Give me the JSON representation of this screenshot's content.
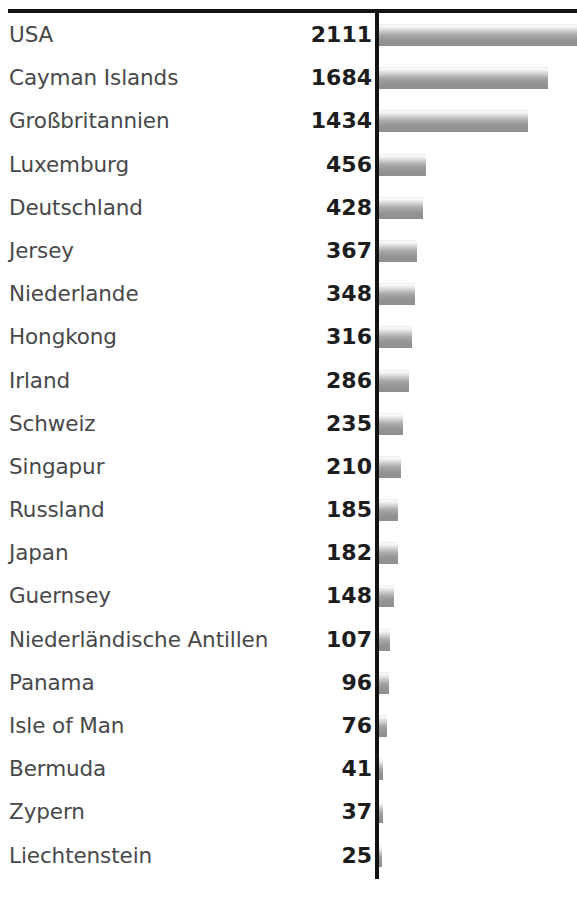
{
  "chart_data": {
    "type": "bar",
    "orientation": "horizontal",
    "title": "",
    "subtitle": "",
    "xlabel": "",
    "ylabel": "",
    "grid": false,
    "legend": null,
    "value_labels_shown": true,
    "axis_max_visible": 1920,
    "categories": [
      "USA",
      "Cayman Islands",
      "Großbritannien",
      "Luxemburg",
      "Deutschland",
      "Jersey",
      "Niederlande",
      "Hongkong",
      "Irland",
      "Schweiz",
      "Singapur",
      "Russland",
      "Japan",
      "Guernsey",
      "Niederländische Antillen",
      "Panama",
      "Isle of Man",
      "Bermuda",
      "Zypern",
      "Liechtenstein"
    ],
    "values": [
      2111,
      1684,
      1434,
      456,
      428,
      367,
      348,
      316,
      286,
      235,
      210,
      185,
      182,
      148,
      107,
      96,
      76,
      41,
      37,
      25
    ]
  },
  "rows": [
    {
      "label": "USA",
      "value": "2111",
      "bar_px": 198,
      "clipped": true
    },
    {
      "label": "Cayman Islands",
      "value": "1684",
      "bar_px": 169,
      "clipped": false
    },
    {
      "label": "Großbritannien",
      "value": "1434",
      "bar_px": 149,
      "clipped": false
    },
    {
      "label": "Luxemburg",
      "value": "456",
      "bar_px": 47,
      "clipped": false
    },
    {
      "label": "Deutschland",
      "value": "428",
      "bar_px": 44,
      "clipped": false
    },
    {
      "label": "Jersey",
      "value": "367",
      "bar_px": 38,
      "clipped": false
    },
    {
      "label": "Niederlande",
      "value": "348",
      "bar_px": 36,
      "clipped": false
    },
    {
      "label": "Hongkong",
      "value": "316",
      "bar_px": 33,
      "clipped": false
    },
    {
      "label": "Irland",
      "value": "286",
      "bar_px": 30,
      "clipped": false
    },
    {
      "label": "Schweiz",
      "value": "235",
      "bar_px": 24,
      "clipped": false
    },
    {
      "label": "Singapur",
      "value": "210",
      "bar_px": 22,
      "clipped": false
    },
    {
      "label": "Russland",
      "value": "185",
      "bar_px": 19,
      "clipped": false
    },
    {
      "label": "Japan",
      "value": "182",
      "bar_px": 19,
      "clipped": false
    },
    {
      "label": "Guernsey",
      "value": "148",
      "bar_px": 15,
      "clipped": false
    },
    {
      "label": "Niederländische Antillen",
      "value": "107",
      "bar_px": 11,
      "clipped": false
    },
    {
      "label": "Panama",
      "value": "96",
      "bar_px": 10,
      "clipped": false
    },
    {
      "label": "Isle of Man",
      "value": "76",
      "bar_px": 8,
      "clipped": false
    },
    {
      "label": "Bermuda",
      "value": "41",
      "bar_px": 4,
      "clipped": false
    },
    {
      "label": "Zypern",
      "value": "37",
      "bar_px": 4,
      "clipped": false
    },
    {
      "label": "Liechtenstein",
      "value": "25",
      "bar_px": 3,
      "clipped": false
    }
  ],
  "colors": {
    "rule": "#141414",
    "axis": "#131313",
    "label_text": "#48484a",
    "value_text": "#1d1d1d",
    "bar_light": "#fdfdfd",
    "bar_dark": "#8f8f8f",
    "background": "#ffffff"
  }
}
